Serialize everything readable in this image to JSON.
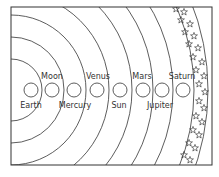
{
  "diagram": {
    "title": "",
    "frame": {
      "x": 11,
      "y": 7,
      "width": 201,
      "height": 158
    },
    "colors": {
      "ink": "#333333",
      "background": "#ffffff"
    },
    "bodies": [
      {
        "label": "Earth",
        "cx": 31,
        "label_pos": "below"
      },
      {
        "label": "Moon",
        "cx": 52,
        "label_pos": "above"
      },
      {
        "label": "Mercury",
        "cx": 74,
        "label_pos": "below"
      },
      {
        "label": "Venus",
        "cx": 97,
        "label_pos": "above"
      },
      {
        "label": "Sun",
        "cx": 120,
        "label_pos": "below"
      },
      {
        "label": "Mars",
        "cx": 143,
        "label_pos": "above"
      },
      {
        "label": "Jupiter",
        "cx": 162,
        "label_pos": "below"
      },
      {
        "label": "Saturn",
        "cx": 183,
        "label_pos": "above"
      }
    ],
    "star_band": {
      "description": "band of stars along outermost arcs",
      "star_icon": "star-outline"
    }
  }
}
